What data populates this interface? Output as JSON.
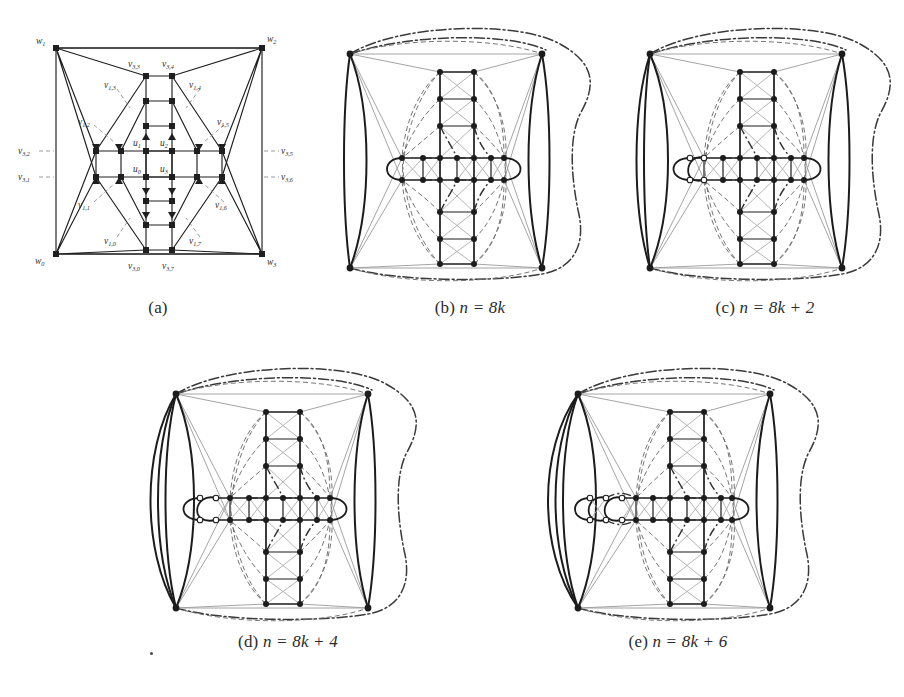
{
  "figure": {
    "type": "multi-panel-graph-figure",
    "background": "#ffffff",
    "ink": "#1f1f1f",
    "panel_count": 5
  },
  "captions": {
    "a": "(a)",
    "b_prefix": "(b)",
    "b_formula": "n = 8k",
    "c_prefix": "(c)",
    "c_formula": "n = 8k + 2",
    "d_prefix": "(d)",
    "d_formula": "n = 8k + 4",
    "e_prefix": "(e)",
    "e_formula": "n = 8k + 6"
  },
  "panel_a_labels": {
    "w0": "w",
    "w0_sub": "0",
    "w1": "w",
    "w1_sub": "1",
    "w2": "w",
    "w2_sub": "2",
    "w3": "w",
    "w3_sub": "3",
    "u0": "u",
    "u0_sub": "0",
    "u1": "u",
    "u1_sub": "1",
    "u2": "u",
    "u2_sub": "2",
    "u3": "u",
    "u3_sub": "3",
    "v10": "v",
    "v10_sub": "1,0",
    "v11": "v",
    "v11_sub": "1,1",
    "v12": "v",
    "v12_sub": "1,2",
    "v13": "v",
    "v13_sub": "1,3",
    "v14": "v",
    "v14_sub": "1,4",
    "v15": "v",
    "v15_sub": "1,5",
    "v16": "v",
    "v16_sub": "1,6",
    "v17": "v",
    "v17_sub": "1,7",
    "v30": "v",
    "v30_sub": "3,0",
    "v31": "v",
    "v31_sub": "3,1",
    "v32": "v",
    "v32_sub": "3,2",
    "v33": "v",
    "v33_sub": "3,3",
    "v34": "v",
    "v34_sub": "3,4",
    "v35": "v",
    "v35_sub": "3,5",
    "v36": "v",
    "v36_sub": "3,6",
    "v37": "v",
    "v37_sub": "3,7"
  },
  "panel_styles": {
    "solid_thick": "#1c1c1c",
    "solid_thin": "#8d8d8d",
    "dashed": "#6b6b6b",
    "dashdot": "#3a3a3a",
    "node_fill": "#1c1c1c",
    "node_hollow_fill": "#ffffff"
  },
  "graph_structure": {
    "shape": "plus-shaped grid with 4 outer apex vertices",
    "apex_vertices": [
      "w0",
      "w1",
      "w2",
      "w3"
    ],
    "center_vertices": [
      "u0",
      "u1",
      "u2",
      "u3"
    ],
    "ring_vertices_v1": [
      "v1,0",
      "v1,1",
      "v1,2",
      "v1,3",
      "v1,4",
      "v1,5",
      "v1,6",
      "v1,7"
    ],
    "ring_vertices_v3": [
      "v3,0",
      "v3,1",
      "v3,2",
      "v3,3",
      "v3,4",
      "v3,5",
      "v3,6",
      "v3,7"
    ]
  }
}
